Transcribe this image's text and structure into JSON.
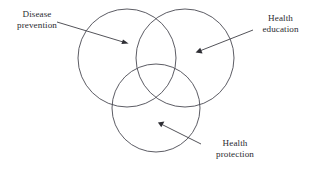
{
  "diagram": {
    "type": "venn-3-circle",
    "background_color": "#ffffff",
    "stroke_color": "#4a4a52",
    "text_color": "#2b2b30",
    "arrow_color": "#2e2e34",
    "canvas": {
      "width": 311,
      "height": 173
    },
    "circles": [
      {
        "id": "disease-prevention",
        "label_lines": [
          "Disease",
          "prevention"
        ],
        "cx": 127,
        "cy": 58,
        "r": 49
      },
      {
        "id": "health-education",
        "label_lines": [
          "Health",
          "education"
        ],
        "cx": 185,
        "cy": 58,
        "r": 49
      },
      {
        "id": "health-protection",
        "label_lines": [
          "Health",
          "protection"
        ],
        "cx": 156,
        "cy": 108,
        "r": 44
      }
    ],
    "labels": {
      "disease_prevention": {
        "line1": "Disease",
        "line2": "prevention"
      },
      "health_education": {
        "line1": "Health",
        "line2": "education"
      },
      "health_protection": {
        "line1": "Health",
        "line2": "protection"
      }
    },
    "arrows": [
      {
        "id": "arrow-disease-prevention",
        "from": {
          "x": 57,
          "y": 22
        },
        "to": {
          "x": 127,
          "y": 43
        },
        "points_to": "disease-prevention"
      },
      {
        "id": "arrow-health-education",
        "from": {
          "x": 253,
          "y": 30
        },
        "to": {
          "x": 197,
          "y": 52
        },
        "points_to": "health-education"
      },
      {
        "id": "arrow-health-protection",
        "from": {
          "x": 201,
          "y": 144
        },
        "to": {
          "x": 159,
          "y": 123
        },
        "points_to": "health-protection"
      }
    ]
  }
}
